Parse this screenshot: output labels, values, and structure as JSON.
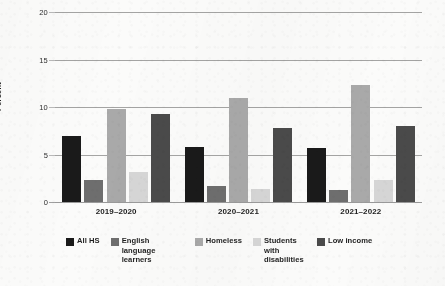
{
  "chart_data": {
    "type": "bar",
    "title": "",
    "subtitle": "",
    "xlabel": "",
    "ylabel": "Percent",
    "categories": [
      "2019–2020",
      "2020–2021",
      "2021–2022"
    ],
    "ylim": [
      0,
      20
    ],
    "ytick_labels": [
      "0",
      "5",
      "10",
      "15",
      "20"
    ],
    "ytick_values": [
      0,
      5,
      10,
      15,
      20
    ],
    "grid": true,
    "legend_position": "bottom",
    "series": [
      {
        "name": "All HS",
        "color": "#1a1a1a",
        "values": [
          6.9,
          5.8,
          5.7
        ]
      },
      {
        "name": "English language learners",
        "color": "#6e6e6e",
        "values": [
          2.3,
          1.7,
          1.3
        ]
      },
      {
        "name": "Homeless",
        "color": "#a9a9a9",
        "values": [
          9.8,
          10.9,
          12.3
        ]
      },
      {
        "name": "Students with disabilities",
        "color": "#d6d6d6",
        "values": [
          3.2,
          1.4,
          2.3
        ]
      },
      {
        "name": "Low income",
        "color": "#4a4a4a",
        "values": [
          9.3,
          7.8,
          8.0
        ]
      }
    ]
  },
  "legend": {
    "items": [
      {
        "label": "All HS"
      },
      {
        "label": "English language learners"
      },
      {
        "label": "Homeless"
      },
      {
        "label": "Students with disabilities"
      },
      {
        "label": "Low income"
      }
    ]
  }
}
